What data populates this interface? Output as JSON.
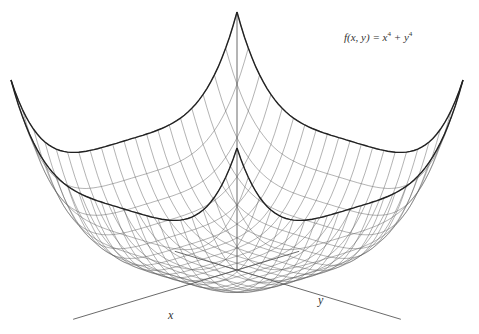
{
  "chart_data": {
    "type": "surface",
    "title_parts": {
      "lhs": "f(x, y) = x",
      "exp1": "4",
      "mid": " + y",
      "exp2": "4"
    },
    "function": "x^4 + y^4",
    "xlabel": "x",
    "ylabel": "y",
    "domain": {
      "x": [
        -1,
        1
      ],
      "y": [
        -1,
        1
      ]
    },
    "grid_lines": 20,
    "style": {
      "mesh_color": "#555555",
      "boundary_color": "#222222",
      "axis_color": "#444444"
    },
    "grid": true,
    "legend": "none"
  }
}
